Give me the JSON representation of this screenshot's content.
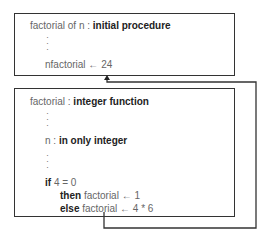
{
  "top_box": {
    "header_plain": "factorial of n",
    "header_sep": " : ",
    "header_bold": "initial procedure",
    "ellipsis": ":\n:\n:",
    "assignment_var": "nfactorial",
    "assignment_arrow": "←",
    "assignment_value": "24"
  },
  "bottom_box": {
    "header_plain": "factorial",
    "header_sep": " : ",
    "header_bold": "integer function",
    "param_name": "n",
    "param_sep": " : ",
    "param_bold": "in only integer",
    "if_kw": "if",
    "if_cond": "4 = 0",
    "then_kw": "then",
    "then_stmt": "factorial ← 1",
    "else_kw": "else",
    "else_stmt": "factorial ← 4 * 6"
  },
  "colors": {
    "line": "#333333",
    "text": "#666666",
    "bold_text": "#222222"
  }
}
